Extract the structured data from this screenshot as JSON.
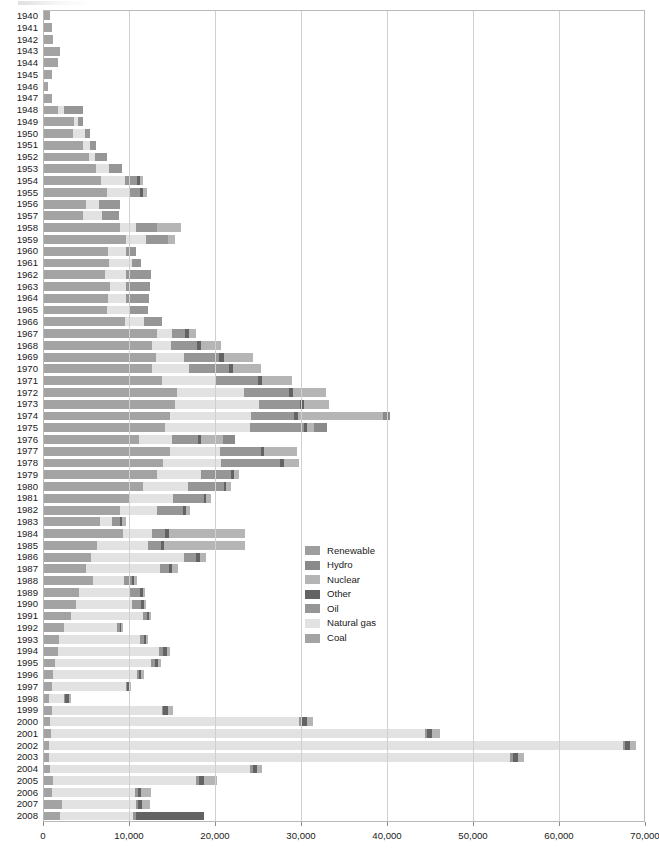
{
  "chart_data": {
    "type": "bar",
    "orientation": "horizontal",
    "stacked": true,
    "title": "",
    "xlabel": "",
    "ylabel": "",
    "xlim": [
      0,
      70000
    ],
    "xticks": [
      0,
      10000,
      20000,
      30000,
      40000,
      50000,
      60000,
      70000
    ],
    "xticklabels": [
      "0",
      "10,000",
      "20,000",
      "30,000",
      "40,000",
      "50,000",
      "60,000",
      "70,000"
    ],
    "grid": true,
    "grid_axis": "x",
    "legend_position": "center",
    "series_order_in_stack": [
      "Coal",
      "Natural gas",
      "Oil",
      "Other",
      "Nuclear",
      "Hydro",
      "Renewable"
    ],
    "series": [
      {
        "name": "Renewable",
        "color": "#9e9e9e"
      },
      {
        "name": "Hydro",
        "color": "#8a8a8a"
      },
      {
        "name": "Nuclear",
        "color": "#b5b5b5"
      },
      {
        "name": "Other",
        "color": "#636363"
      },
      {
        "name": "Oil",
        "color": "#969696"
      },
      {
        "name": "Natural gas",
        "color": "#e2e2e2"
      },
      {
        "name": "Coal",
        "color": "#a3a3a3"
      }
    ],
    "categories": [
      "1940",
      "1941",
      "1942",
      "1943",
      "1944",
      "1945",
      "1946",
      "1947",
      "1948",
      "1949",
      "1950",
      "1951",
      "1952",
      "1953",
      "1954",
      "1955",
      "1956",
      "1957",
      "1958",
      "1959",
      "1960",
      "1961",
      "1962",
      "1963",
      "1964",
      "1965",
      "1966",
      "1967",
      "1968",
      "1969",
      "1970",
      "1971",
      "1972",
      "1973",
      "1974",
      "1975",
      "1976",
      "1977",
      "1978",
      "1979",
      "1980",
      "1981",
      "1982",
      "1983",
      "1984",
      "1985",
      "1986",
      "1987",
      "1988",
      "1989",
      "1990",
      "1991",
      "1992",
      "1993",
      "1994",
      "1995",
      "1996",
      "1997",
      "1998",
      "1999",
      "2000",
      "2001",
      "2002",
      "2003",
      "2004",
      "2005",
      "2006",
      "2007",
      "2008"
    ],
    "rows": [
      {
        "year": "1940",
        "Coal": 850,
        "Natural gas": 0,
        "Oil": 0,
        "Other": 0,
        "Nuclear": 0,
        "Hydro": 0,
        "Renewable": 0
      },
      {
        "year": "1941",
        "Coal": 1000,
        "Natural gas": 0,
        "Oil": 0,
        "Other": 0,
        "Nuclear": 0,
        "Hydro": 0,
        "Renewable": 0
      },
      {
        "year": "1942",
        "Coal": 1150,
        "Natural gas": 0,
        "Oil": 0,
        "Other": 0,
        "Nuclear": 0,
        "Hydro": 0,
        "Renewable": 0
      },
      {
        "year": "1943",
        "Coal": 1950,
        "Natural gas": 0,
        "Oil": 0,
        "Other": 0,
        "Nuclear": 0,
        "Hydro": 0,
        "Renewable": 0
      },
      {
        "year": "1944",
        "Coal": 1800,
        "Natural gas": 0,
        "Oil": 0,
        "Other": 0,
        "Nuclear": 0,
        "Hydro": 0,
        "Renewable": 0
      },
      {
        "year": "1945",
        "Coal": 1050,
        "Natural gas": 0,
        "Oil": 0,
        "Other": 0,
        "Nuclear": 0,
        "Hydro": 0,
        "Renewable": 0
      },
      {
        "year": "1946",
        "Coal": 600,
        "Natural gas": 0,
        "Oil": 0,
        "Other": 0,
        "Nuclear": 0,
        "Hydro": 0,
        "Renewable": 0
      },
      {
        "year": "1947",
        "Coal": 1100,
        "Natural gas": 0,
        "Oil": 0,
        "Other": 0,
        "Nuclear": 0,
        "Hydro": 0,
        "Renewable": 0
      },
      {
        "year": "1948",
        "Coal": 1800,
        "Natural gas": 700,
        "Oil": 2200,
        "Other": 0,
        "Nuclear": 0,
        "Hydro": 0,
        "Renewable": 0
      },
      {
        "year": "1949",
        "Coal": 3600,
        "Natural gas": 500,
        "Oil": 500,
        "Other": 0,
        "Nuclear": 0,
        "Hydro": 0,
        "Renewable": 0
      },
      {
        "year": "1950",
        "Coal": 3500,
        "Natural gas": 1400,
        "Oil": 600,
        "Other": 0,
        "Nuclear": 0,
        "Hydro": 0,
        "Renewable": 0
      },
      {
        "year": "1951",
        "Coal": 4600,
        "Natural gas": 900,
        "Oil": 700,
        "Other": 0,
        "Nuclear": 0,
        "Hydro": 0,
        "Renewable": 0
      },
      {
        "year": "1952",
        "Coal": 5400,
        "Natural gas": 700,
        "Oil": 1400,
        "Other": 0,
        "Nuclear": 0,
        "Hydro": 0,
        "Renewable": 0
      },
      {
        "year": "1953",
        "Coal": 6200,
        "Natural gas": 1500,
        "Oil": 1500,
        "Other": 0,
        "Nuclear": 0,
        "Hydro": 0,
        "Renewable": 0
      },
      {
        "year": "1954",
        "Coal": 6800,
        "Natural gas": 2700,
        "Oil": 1400,
        "Other": 350,
        "Nuclear": 400,
        "Hydro": 0,
        "Renewable": 0
      },
      {
        "year": "1955",
        "Coal": 7400,
        "Natural gas": 2700,
        "Oil": 1200,
        "Other": 350,
        "Nuclear": 500,
        "Hydro": 0,
        "Renewable": 0
      },
      {
        "year": "1956",
        "Coal": 5000,
        "Natural gas": 1500,
        "Oil": 2500,
        "Other": 0,
        "Nuclear": 0,
        "Hydro": 0,
        "Renewable": 0
      },
      {
        "year": "1957",
        "Coal": 4700,
        "Natural gas": 2200,
        "Oil": 1900,
        "Other": 0,
        "Nuclear": 0,
        "Hydro": 0,
        "Renewable": 0
      },
      {
        "year": "1958",
        "Coal": 8900,
        "Natural gas": 1900,
        "Oil": 2500,
        "Other": 0,
        "Nuclear": 2700,
        "Hydro": 0,
        "Renewable": 0
      },
      {
        "year": "1959",
        "Coal": 9600,
        "Natural gas": 2400,
        "Oil": 2500,
        "Other": 0,
        "Nuclear": 800,
        "Hydro": 0,
        "Renewable": 0
      },
      {
        "year": "1960",
        "Coal": 7600,
        "Natural gas": 2000,
        "Oil": 1200,
        "Other": 0,
        "Nuclear": 0,
        "Hydro": 0,
        "Renewable": 0
      },
      {
        "year": "1961",
        "Coal": 7700,
        "Natural gas": 2600,
        "Oil": 1100,
        "Other": 0,
        "Nuclear": 0,
        "Hydro": 0,
        "Renewable": 0
      },
      {
        "year": "1962",
        "Coal": 7200,
        "Natural gas": 2500,
        "Oil": 2900,
        "Other": 0,
        "Nuclear": 0,
        "Hydro": 0,
        "Renewable": 0
      },
      {
        "year": "1963",
        "Coal": 7800,
        "Natural gas": 1900,
        "Oil": 2700,
        "Other": 0,
        "Nuclear": 0,
        "Hydro": 0,
        "Renewable": 0
      },
      {
        "year": "1964",
        "Coal": 7600,
        "Natural gas": 2100,
        "Oil": 2600,
        "Other": 0,
        "Nuclear": 0,
        "Hydro": 0,
        "Renewable": 0
      },
      {
        "year": "1965",
        "Coal": 7400,
        "Natural gas": 2700,
        "Oil": 2100,
        "Other": 0,
        "Nuclear": 0,
        "Hydro": 0,
        "Renewable": 0
      },
      {
        "year": "1966",
        "Coal": 9500,
        "Natural gas": 2200,
        "Oil": 2100,
        "Other": 0,
        "Nuclear": 0,
        "Hydro": 0,
        "Renewable": 0
      },
      {
        "year": "1967",
        "Coal": 13300,
        "Natural gas": 1700,
        "Oil": 1500,
        "Other": 450,
        "Nuclear": 900,
        "Hydro": 0,
        "Renewable": 0
      },
      {
        "year": "1968",
        "Coal": 12700,
        "Natural gas": 2200,
        "Oil": 3000,
        "Other": 450,
        "Nuclear": 2400,
        "Hydro": 0,
        "Renewable": 0
      },
      {
        "year": "1969",
        "Coal": 13100,
        "Natural gas": 3300,
        "Oil": 4100,
        "Other": 500,
        "Nuclear": 3400,
        "Hydro": 0,
        "Renewable": 0
      },
      {
        "year": "1970",
        "Coal": 12700,
        "Natural gas": 4300,
        "Oil": 4600,
        "Other": 500,
        "Nuclear": 3300,
        "Hydro": 0,
        "Renewable": 0
      },
      {
        "year": "1971",
        "Coal": 13800,
        "Natural gas": 6200,
        "Oil": 5000,
        "Other": 500,
        "Nuclear": 3400,
        "Hydro": 0,
        "Renewable": 0
      },
      {
        "year": "1972",
        "Coal": 15600,
        "Natural gas": 7800,
        "Oil": 5200,
        "Other": 500,
        "Nuclear": 3800,
        "Hydro": 0,
        "Renewable": 0
      },
      {
        "year": "1973",
        "Coal": 15400,
        "Natural gas": 9700,
        "Oil": 4800,
        "Other": 500,
        "Nuclear": 2900,
        "Hydro": 0,
        "Renewable": 0
      },
      {
        "year": "1974",
        "Coal": 14800,
        "Natural gas": 9400,
        "Oil": 5000,
        "Other": 500,
        "Nuclear": 9800,
        "Hydro": 800,
        "Renewable": 0
      },
      {
        "year": "1975",
        "Coal": 14200,
        "Natural gas": 9900,
        "Oil": 6200,
        "Other": 400,
        "Nuclear": 800,
        "Hydro": 1500,
        "Renewable": 0
      },
      {
        "year": "1976",
        "Coal": 11200,
        "Natural gas": 3800,
        "Oil": 3000,
        "Other": 400,
        "Nuclear": 2500,
        "Hydro": 1400,
        "Renewable": 0
      },
      {
        "year": "1977",
        "Coal": 14800,
        "Natural gas": 5800,
        "Oil": 4700,
        "Other": 400,
        "Nuclear": 3800,
        "Hydro": 0,
        "Renewable": 0
      },
      {
        "year": "1978",
        "Coal": 13900,
        "Natural gas": 6800,
        "Oil": 6900,
        "Other": 400,
        "Nuclear": 1800,
        "Hydro": 0,
        "Renewable": 0
      },
      {
        "year": "1979",
        "Coal": 13200,
        "Natural gas": 5200,
        "Oil": 3500,
        "Other": 300,
        "Nuclear": 600,
        "Hydro": 0,
        "Renewable": 0
      },
      {
        "year": "1980",
        "Coal": 11600,
        "Natural gas": 5300,
        "Oil": 4100,
        "Other": 300,
        "Nuclear": 600,
        "Hydro": 0,
        "Renewable": 0
      },
      {
        "year": "1981",
        "Coal": 10100,
        "Natural gas": 5000,
        "Oil": 3600,
        "Other": 300,
        "Nuclear": 500,
        "Hydro": 0,
        "Renewable": 0
      },
      {
        "year": "1982",
        "Coal": 8900,
        "Natural gas": 4300,
        "Oil": 3100,
        "Other": 300,
        "Nuclear": 500,
        "Hydro": 0,
        "Renewable": 0
      },
      {
        "year": "1983",
        "Coal": 6600,
        "Natural gas": 1400,
        "Oil": 900,
        "Other": 300,
        "Nuclear": 400,
        "Hydro": 0,
        "Renewable": 0
      },
      {
        "year": "1984",
        "Coal": 9300,
        "Natural gas": 3400,
        "Oil": 1500,
        "Other": 400,
        "Nuclear": 8900,
        "Hydro": 0,
        "Renewable": 0
      },
      {
        "year": "1985",
        "Coal": 6300,
        "Natural gas": 5900,
        "Oil": 1500,
        "Other": 400,
        "Nuclear": 9400,
        "Hydro": 0,
        "Renewable": 0
      },
      {
        "year": "1986",
        "Coal": 5600,
        "Natural gas": 10800,
        "Oil": 1400,
        "Other": 400,
        "Nuclear": 800,
        "Hydro": 0,
        "Renewable": 0
      },
      {
        "year": "1987",
        "Coal": 5000,
        "Natural gas": 8600,
        "Oil": 1100,
        "Other": 300,
        "Nuclear": 700,
        "Hydro": 0,
        "Renewable": 0
      },
      {
        "year": "1988",
        "Coal": 5800,
        "Natural gas": 3600,
        "Oil": 900,
        "Other": 300,
        "Nuclear": 300,
        "Hydro": 0,
        "Renewable": 0
      },
      {
        "year": "1989",
        "Coal": 4200,
        "Natural gas": 5900,
        "Oil": 1200,
        "Other": 300,
        "Nuclear": 300,
        "Hydro": 0,
        "Renewable": 0
      },
      {
        "year": "1990",
        "Coal": 3800,
        "Natural gas": 6600,
        "Oil": 1000,
        "Other": 300,
        "Nuclear": 300,
        "Hydro": 0,
        "Renewable": 0
      },
      {
        "year": "1991",
        "Coal": 3200,
        "Natural gas": 8400,
        "Oil": 500,
        "Other": 250,
        "Nuclear": 250,
        "Hydro": 0,
        "Renewable": 0
      },
      {
        "year": "1992",
        "Coal": 2400,
        "Natural gas": 6200,
        "Oil": 300,
        "Other": 200,
        "Nuclear": 200,
        "Hydro": 0,
        "Renewable": 0
      },
      {
        "year": "1993",
        "Coal": 1900,
        "Natural gas": 9400,
        "Oil": 400,
        "Other": 250,
        "Nuclear": 250,
        "Hydro": 0,
        "Renewable": 0
      },
      {
        "year": "1994",
        "Coal": 1700,
        "Natural gas": 11800,
        "Oil": 500,
        "Other": 400,
        "Nuclear": 400,
        "Hydro": 0,
        "Renewable": 0
      },
      {
        "year": "1995",
        "Coal": 1400,
        "Natural gas": 11200,
        "Oil": 400,
        "Other": 350,
        "Nuclear": 400,
        "Hydro": 0,
        "Renewable": 0
      },
      {
        "year": "1996",
        "Coal": 1200,
        "Natural gas": 9700,
        "Oil": 300,
        "Other": 250,
        "Nuclear": 300,
        "Hydro": 0,
        "Renewable": 0
      },
      {
        "year": "1997",
        "Coal": 1000,
        "Natural gas": 8600,
        "Oil": 200,
        "Other": 200,
        "Nuclear": 200,
        "Hydro": 0,
        "Renewable": 0
      },
      {
        "year": "1998",
        "Coal": 700,
        "Natural gas": 1700,
        "Oil": 200,
        "Other": 400,
        "Nuclear": 300,
        "Hydro": 0,
        "Renewable": 0
      },
      {
        "year": "1999",
        "Coal": 1000,
        "Natural gas": 12800,
        "Oil": 200,
        "Other": 500,
        "Nuclear": 600,
        "Hydro": 0,
        "Renewable": 0
      },
      {
        "year": "2000",
        "Coal": 800,
        "Natural gas": 29000,
        "Oil": 250,
        "Other": 600,
        "Nuclear": 700,
        "Hydro": 0,
        "Renewable": 0
      },
      {
        "year": "2001",
        "Coal": 900,
        "Natural gas": 43500,
        "Oil": 250,
        "Other": 600,
        "Nuclear": 900,
        "Hydro": 0,
        "Renewable": 0
      },
      {
        "year": "2002",
        "Coal": 700,
        "Natural gas": 66700,
        "Oil": 300,
        "Other": 600,
        "Nuclear": 700,
        "Hydro": 0,
        "Renewable": 0
      },
      {
        "year": "2003",
        "Coal": 700,
        "Natural gas": 53600,
        "Oil": 300,
        "Other": 600,
        "Nuclear": 700,
        "Hydro": 0,
        "Renewable": 0
      },
      {
        "year": "2004",
        "Coal": 800,
        "Natural gas": 23300,
        "Oil": 300,
        "Other": 500,
        "Nuclear": 600,
        "Hydro": 0,
        "Renewable": 0
      },
      {
        "year": "2005",
        "Coal": 1200,
        "Natural gas": 16600,
        "Oil": 300,
        "Other": 600,
        "Nuclear": 1500,
        "Hydro": 0,
        "Renewable": 0
      },
      {
        "year": "2006",
        "Coal": 1100,
        "Natural gas": 9600,
        "Oil": 300,
        "Other": 400,
        "Nuclear": 1200,
        "Hydro": 0,
        "Renewable": 0
      },
      {
        "year": "2007",
        "Coal": 2200,
        "Natural gas": 8600,
        "Oil": 300,
        "Other": 400,
        "Nuclear": 1000,
        "Hydro": 0,
        "Renewable": 0
      },
      {
        "year": "2008",
        "Coal": 2000,
        "Natural gas": 8500,
        "Oil": 300,
        "Other": 7900,
        "Nuclear": 0,
        "Hydro": 0,
        "Renewable": 0
      }
    ]
  },
  "legend": {
    "items": [
      {
        "label": "Renewable",
        "color": "#9e9e9e"
      },
      {
        "label": "Hydro",
        "color": "#8a8a8a"
      },
      {
        "label": "Nuclear",
        "color": "#b5b5b5"
      },
      {
        "label": "Other",
        "color": "#636363"
      },
      {
        "label": "Oil",
        "color": "#969696"
      },
      {
        "label": "Natural gas",
        "color": "#e2e2e2"
      },
      {
        "label": "Coal",
        "color": "#a3a3a3"
      }
    ]
  },
  "axes": {
    "x": {
      "ticks": [
        "0",
        "10,000",
        "20,000",
        "30,000",
        "40,000",
        "50,000",
        "60,000",
        "70,000"
      ],
      "min": 0,
      "max": 70000
    }
  }
}
